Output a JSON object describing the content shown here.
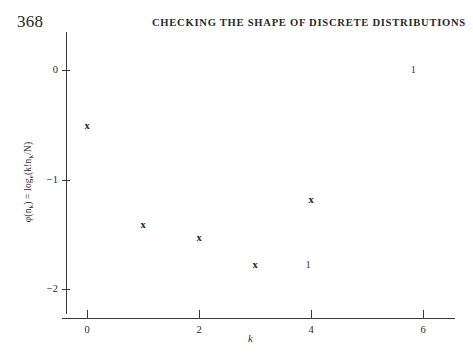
{
  "page": {
    "folio": "368",
    "running_title": "CHECKING THE SHAPE OF DISCRETE DISTRIBUTIONS"
  },
  "chart_data": {
    "type": "scatter",
    "title": "",
    "xlabel": "k",
    "ylabel": "φ(nₖ) = logₑ(k!nₖ/N)",
    "ylabel_parts": {
      "phi": "φ(n",
      "phi_sub": "k",
      "phi_close": ") = log",
      "log_sub": "e",
      "arg": "(k!n",
      "arg_sub": "k",
      "arg_close": "/N)"
    },
    "xlim": [
      -0.9,
      7.0
    ],
    "ylim": [
      -2.3,
      0.38
    ],
    "xticks": [
      0,
      2,
      4,
      6
    ],
    "xticklabels": [
      "0",
      "2",
      "4",
      "6"
    ],
    "yticks": [
      0,
      -1,
      -2
    ],
    "yticklabels": [
      "0",
      "−1",
      "−2"
    ],
    "grid": false,
    "legend": "none",
    "marker": "x",
    "x": [
      0,
      1,
      2,
      3,
      4
    ],
    "y": [
      -0.51,
      -1.42,
      -1.53,
      -1.78,
      -1.19
    ],
    "points": [
      {
        "k": 0,
        "phi": -0.51,
        "marker": "x"
      },
      {
        "k": 1,
        "phi": -1.42,
        "marker": "x"
      },
      {
        "k": 2,
        "phi": -1.53,
        "marker": "x"
      },
      {
        "k": 3,
        "phi": -1.78,
        "marker": "x"
      },
      {
        "k": 4,
        "phi": -1.19,
        "marker": "x"
      }
    ],
    "annotations": [
      {
        "text": "1",
        "k": 5.83,
        "phi": 0.0
      },
      {
        "text": "1",
        "k": 3.95,
        "phi": -1.78
      }
    ]
  }
}
